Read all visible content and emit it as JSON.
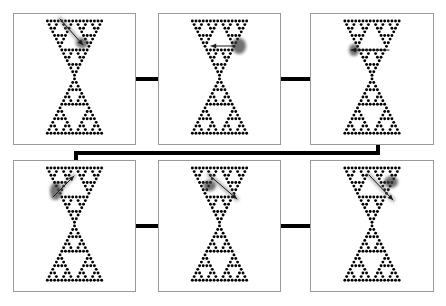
{
  "figure": {
    "name": "sierpinski-hourglass-panel-grid",
    "background_color": "#ffffff",
    "width": 446,
    "height": 306,
    "panel_border_color": "#9a9a9a",
    "dot_color": "#000000",
    "connector_color": "#000000",
    "arrow_color": "#808080",
    "arrow_dark_color": "#3a3a3a"
  },
  "pattern": {
    "type": "sierpinski-hourglass",
    "description": "Inverted Sierpinski gasket over upright Sierpinski gasket forming an hourglass of dots",
    "rows_top": 16,
    "rows_bottom": 16,
    "dot_radius": 1.45,
    "spacing_x": 3.62,
    "spacing_y": 3.62
  },
  "panels": [
    {
      "id": "panel-1",
      "index": 1,
      "label": "a",
      "x": 13,
      "y": 13,
      "width": 123,
      "height": 132,
      "arrow": {
        "name": "arrow-down-right",
        "direction": "down-right",
        "x1": 60,
        "y1": 19,
        "x2": 83,
        "y2": 45,
        "blob_x": 76,
        "blob_y": 38,
        "blob_w": 12,
        "blob_h": 10
      }
    },
    {
      "id": "panel-2",
      "index": 2,
      "label": "b",
      "x": 158,
      "y": 13,
      "width": 123,
      "height": 132,
      "arrow": {
        "name": "arrow-left",
        "direction": "left",
        "x1": 234,
        "y1": 46,
        "x2": 211,
        "y2": 46,
        "blob_x": 232,
        "blob_y": 38,
        "blob_w": 14,
        "blob_h": 16
      }
    },
    {
      "id": "panel-3",
      "index": 3,
      "label": "c",
      "x": 310,
      "y": 13,
      "width": 124,
      "height": 132,
      "arrow": {
        "name": "arrow-left-horizontal",
        "direction": "left",
        "x1": 389,
        "y1": 50,
        "x2": 351,
        "y2": 50,
        "blob_x": 349,
        "blob_y": 44,
        "blob_w": 10,
        "blob_h": 12
      }
    },
    {
      "id": "panel-4",
      "index": 4,
      "label": "d",
      "x": 13,
      "y": 160,
      "width": 123,
      "height": 132,
      "arrow": {
        "name": "arrow-up-right",
        "direction": "up-right",
        "x1": 53,
        "y1": 197,
        "x2": 74,
        "y2": 176,
        "blob_x": 50,
        "blob_y": 182,
        "blob_w": 12,
        "blob_h": 18
      }
    },
    {
      "id": "panel-5",
      "index": 5,
      "label": "e",
      "x": 158,
      "y": 160,
      "width": 123,
      "height": 132,
      "arrow": {
        "name": "arrow-down-right",
        "direction": "down-right",
        "x1": 209,
        "y1": 175,
        "x2": 237,
        "y2": 199,
        "blob_x": 203,
        "blob_y": 180,
        "blob_w": 13,
        "blob_h": 11
      }
    },
    {
      "id": "panel-6",
      "index": 6,
      "label": "f",
      "x": 310,
      "y": 160,
      "width": 124,
      "height": 132,
      "arrow": {
        "name": "arrow-down-right",
        "direction": "down-right",
        "x1": 369,
        "y1": 175,
        "x2": 393,
        "y2": 200,
        "blob_x": 384,
        "blob_y": 176,
        "blob_w": 14,
        "blob_h": 12
      }
    }
  ],
  "connectors": [
    {
      "id": "connector-1-2",
      "name": "connector-panel1-panel2",
      "orientation": "horizontal",
      "x": 136,
      "y": 77,
      "width": 22,
      "height": 4
    },
    {
      "id": "connector-2-3",
      "name": "connector-panel2-panel3",
      "orientation": "horizontal",
      "x": 281,
      "y": 77,
      "width": 29,
      "height": 4
    },
    {
      "id": "connector-4-5",
      "name": "connector-panel4-panel5",
      "orientation": "horizontal",
      "x": 136,
      "y": 224,
      "width": 22,
      "height": 4
    },
    {
      "id": "connector-5-6",
      "name": "connector-panel5-panel6",
      "orientation": "horizontal",
      "x": 281,
      "y": 224,
      "width": 29,
      "height": 4
    }
  ],
  "wrap_connector": {
    "id": "connector-3-4",
    "name": "connector-panel3-panel4-wrap",
    "description": "Z-shaped bus linking bottom-right of panel 3 to top-left of panel 4",
    "points": [
      {
        "x": 378,
        "y": 145
      },
      {
        "x": 378,
        "y": 153
      },
      {
        "x": 76,
        "y": 153
      },
      {
        "x": 76,
        "y": 160
      }
    ],
    "thickness": 4
  }
}
